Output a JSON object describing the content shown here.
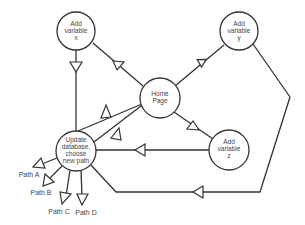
{
  "diagram": {
    "type": "flow-diagram",
    "nodes": [
      {
        "id": "add-x",
        "lines": [
          "Add",
          "variable",
          "x"
        ]
      },
      {
        "id": "add-y",
        "lines": [
          "Add",
          "variable",
          "y"
        ]
      },
      {
        "id": "home",
        "lines": [
          "Home",
          "Page"
        ]
      },
      {
        "id": "add-z",
        "lines": [
          "Add",
          "variable",
          "z"
        ]
      },
      {
        "id": "update",
        "lines": [
          "Update",
          "database,",
          "choose",
          "new path"
        ]
      }
    ],
    "outputs": [
      {
        "id": "path-a",
        "label": "Path A"
      },
      {
        "id": "path-b",
        "label": "Path B"
      },
      {
        "id": "path-c",
        "label": "Path C"
      },
      {
        "id": "path-d",
        "label": "Path D"
      }
    ],
    "edges": [
      {
        "from": "home",
        "to": "add-x"
      },
      {
        "from": "home",
        "to": "add-y"
      },
      {
        "from": "home",
        "to": "add-z"
      },
      {
        "from": "update",
        "to": "home"
      },
      {
        "from": "add-x",
        "to": "update"
      },
      {
        "from": "add-z",
        "to": "update"
      },
      {
        "from": "add-y",
        "to": "update"
      },
      {
        "from": "update",
        "to": "path-a"
      },
      {
        "from": "update",
        "to": "path-b"
      },
      {
        "from": "update",
        "to": "path-c"
      },
      {
        "from": "update",
        "to": "path-d"
      }
    ],
    "colors": {
      "stroke": "#333333",
      "text": "#444444",
      "background": "#ffffff"
    }
  }
}
